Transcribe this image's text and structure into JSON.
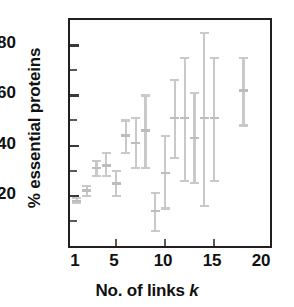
{
  "chart_data": {
    "type": "scatter",
    "title": "",
    "xlabel": "No. of links k",
    "xlabel_plain": "No. of links ",
    "xlabel_italic": "k",
    "ylabel": "% essential proteins",
    "xlim": [
      0.3,
      20.7
    ],
    "ylim": [
      0,
      90
    ],
    "xticks": [
      1,
      5,
      10,
      15,
      20
    ],
    "xticklabels": [
      "1",
      "5",
      "10",
      "15",
      "20"
    ],
    "yticks": [
      0,
      10,
      20,
      30,
      40,
      50,
      60,
      70,
      80,
      90
    ],
    "yticklabels_shown": [
      20,
      40,
      60,
      80
    ],
    "grid": false,
    "legend": null,
    "marker_color": "#b5b5b5",
    "errorbar_color": "#c9c9c9",
    "axis_color": "#231f20",
    "series_name": "% essential proteins vs number of links",
    "x": [
      1,
      2,
      3,
      4,
      5,
      6,
      7,
      8,
      9,
      10,
      11,
      12,
      13,
      14,
      15,
      18
    ],
    "y": [
      18,
      22,
      31,
      32,
      25,
      44,
      41,
      46,
      14,
      29,
      51,
      51,
      43,
      51,
      51,
      62
    ],
    "yerr_low": [
      17,
      20,
      28,
      28,
      20,
      37,
      31,
      31,
      6,
      15,
      35,
      26,
      25,
      16,
      26,
      48
    ],
    "yerr_high": [
      19,
      24,
      34,
      37,
      30,
      50,
      51,
      60,
      21,
      44,
      66,
      75,
      61,
      85,
      75,
      75
    ],
    "points": [
      {
        "k": 1,
        "value": 18,
        "low": 17,
        "high": 19
      },
      {
        "k": 2,
        "value": 22,
        "low": 20,
        "high": 24
      },
      {
        "k": 3,
        "value": 31,
        "low": 28,
        "high": 34
      },
      {
        "k": 4,
        "value": 32,
        "low": 28,
        "high": 37
      },
      {
        "k": 5,
        "value": 25,
        "low": 20,
        "high": 30
      },
      {
        "k": 6,
        "value": 44,
        "low": 37,
        "high": 50
      },
      {
        "k": 7,
        "value": 41,
        "low": 31,
        "high": 51
      },
      {
        "k": 8,
        "value": 46,
        "low": 31,
        "high": 60
      },
      {
        "k": 9,
        "value": 14,
        "low": 6,
        "high": 21
      },
      {
        "k": 10,
        "value": 29,
        "low": 15,
        "high": 44
      },
      {
        "k": 11,
        "value": 51,
        "low": 35,
        "high": 66
      },
      {
        "k": 12,
        "value": 51,
        "low": 26,
        "high": 75
      },
      {
        "k": 13,
        "value": 43,
        "low": 25,
        "high": 61
      },
      {
        "k": 14,
        "value": 51,
        "low": 16,
        "high": 85
      },
      {
        "k": 15,
        "value": 51,
        "low": 26,
        "high": 75
      },
      {
        "k": 18,
        "value": 62,
        "low": 48,
        "high": 75
      }
    ]
  }
}
